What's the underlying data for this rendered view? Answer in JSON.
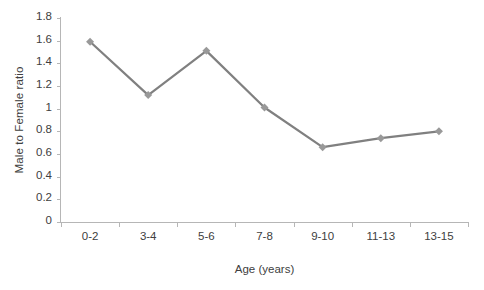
{
  "chart_data": {
    "type": "line",
    "title": "",
    "xlabel": "Age (years)",
    "ylabel": "Male to Female ratio",
    "categories": [
      "0-2",
      "3-4",
      "5-6",
      "7-8",
      "9-10",
      "11-13",
      "13-15"
    ],
    "values": [
      1.59,
      1.12,
      1.51,
      1.01,
      0.66,
      0.74,
      0.8
    ],
    "series": [
      {
        "name": "Male to Female ratio",
        "values": [
          1.59,
          1.12,
          1.51,
          1.01,
          0.66,
          0.74,
          0.8
        ]
      }
    ],
    "ylim": [
      0,
      1.8
    ],
    "ytick_labels": [
      "0",
      "0.2",
      "0.4",
      "0.6",
      "0.8",
      "1",
      "1.2",
      "1.4",
      "1.6",
      "1.8"
    ],
    "ytick_values": [
      0,
      0.2,
      0.4,
      0.6,
      0.8,
      1,
      1.2,
      1.4,
      1.6,
      1.8
    ],
    "grid": false,
    "legend": "none",
    "marker": "diamond",
    "line_color": "#808080",
    "marker_color": "#999999",
    "axis_color": "#b6b6b6",
    "text_color": "#404040",
    "background": "#ffffff"
  }
}
